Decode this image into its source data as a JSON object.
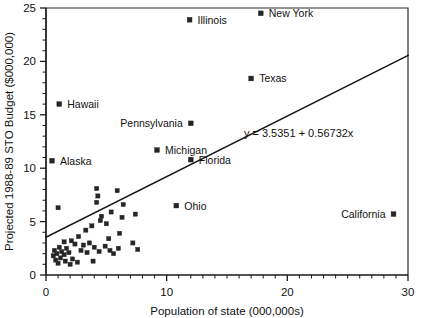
{
  "chart_data": {
    "type": "scatter",
    "title": "",
    "xlabel": "Population of state (000,000s)",
    "ylabel": "Projected 1988-89 STO Budget ($000,000)",
    "xlim": [
      0,
      30
    ],
    "ylim": [
      0,
      25
    ],
    "xticks": [
      0,
      10,
      20,
      30
    ],
    "yticks": [
      0,
      5,
      10,
      15,
      20,
      25
    ],
    "xtick_labels": [
      "0",
      "10",
      "20",
      "30"
    ],
    "ytick_labels": [
      "0",
      "5",
      "10",
      "15",
      "20",
      "25"
    ],
    "x_minor_step": 1,
    "y_minor_step": 1,
    "grid": false,
    "legend": "none",
    "marker": "filled-square",
    "marker_color": "#262626",
    "trendline": {
      "type": "linear",
      "intercept": 3.5351,
      "slope": 0.56732,
      "equation": "y = 3.5351 + 0.56732x",
      "label_x": 16.4,
      "label_y": 12.9,
      "x_start": 0,
      "x_end": 30
    },
    "labeled_points": [
      {
        "label": "New York",
        "x": 17.8,
        "y": 24.5,
        "label_side": "right"
      },
      {
        "label": "Illinois",
        "x": 11.9,
        "y": 23.9,
        "label_side": "right"
      },
      {
        "label": "Texas",
        "x": 17.0,
        "y": 18.4,
        "label_side": "right"
      },
      {
        "label": "Hawaii",
        "x": 1.1,
        "y": 16.0,
        "label_side": "right"
      },
      {
        "label": "Pennsylvania",
        "x": 12.0,
        "y": 14.2,
        "label_side": "left"
      },
      {
        "label": "Michigan",
        "x": 9.2,
        "y": 11.7,
        "label_side": "right"
      },
      {
        "label": "Alaska",
        "x": 0.5,
        "y": 10.7,
        "label_side": "right"
      },
      {
        "label": "Florida",
        "x": 12.0,
        "y": 10.8,
        "label_side": "right"
      },
      {
        "label": "Ohio",
        "x": 10.8,
        "y": 6.5,
        "label_side": "right"
      },
      {
        "label": "California",
        "x": 28.8,
        "y": 5.7,
        "label_side": "left"
      }
    ],
    "unlabeled_points": [
      {
        "x": 1.0,
        "y": 6.3
      },
      {
        "x": 4.2,
        "y": 8.1
      },
      {
        "x": 4.3,
        "y": 7.4
      },
      {
        "x": 4.2,
        "y": 6.8
      },
      {
        "x": 5.9,
        "y": 7.9
      },
      {
        "x": 6.4,
        "y": 6.6
      },
      {
        "x": 5.4,
        "y": 5.9
      },
      {
        "x": 4.6,
        "y": 5.5
      },
      {
        "x": 4.5,
        "y": 5.1
      },
      {
        "x": 3.8,
        "y": 4.6
      },
      {
        "x": 5.0,
        "y": 4.8
      },
      {
        "x": 6.3,
        "y": 5.4
      },
      {
        "x": 7.4,
        "y": 5.7
      },
      {
        "x": 3.3,
        "y": 4.2
      },
      {
        "x": 2.7,
        "y": 3.6
      },
      {
        "x": 2.1,
        "y": 3.2
      },
      {
        "x": 1.5,
        "y": 3.1
      },
      {
        "x": 2.4,
        "y": 2.9
      },
      {
        "x": 3.1,
        "y": 2.8
      },
      {
        "x": 3.6,
        "y": 3.0
      },
      {
        "x": 5.2,
        "y": 3.4
      },
      {
        "x": 6.1,
        "y": 3.9
      },
      {
        "x": 7.2,
        "y": 3.0
      },
      {
        "x": 7.6,
        "y": 2.4
      },
      {
        "x": 0.7,
        "y": 2.3
      },
      {
        "x": 0.9,
        "y": 2.0
      },
      {
        "x": 1.1,
        "y": 2.6
      },
      {
        "x": 1.3,
        "y": 2.2
      },
      {
        "x": 1.5,
        "y": 1.9
      },
      {
        "x": 1.7,
        "y": 2.5
      },
      {
        "x": 1.9,
        "y": 2.1
      },
      {
        "x": 1.2,
        "y": 1.6
      },
      {
        "x": 0.8,
        "y": 1.4
      },
      {
        "x": 2.2,
        "y": 1.5
      },
      {
        "x": 2.9,
        "y": 2.3
      },
      {
        "x": 3.4,
        "y": 2.1
      },
      {
        "x": 4.0,
        "y": 2.6
      },
      {
        "x": 4.4,
        "y": 2.2
      },
      {
        "x": 4.9,
        "y": 2.7
      },
      {
        "x": 5.6,
        "y": 2.0
      },
      {
        "x": 6.0,
        "y": 2.5
      },
      {
        "x": 2.6,
        "y": 1.2
      },
      {
        "x": 3.9,
        "y": 1.3
      },
      {
        "x": 1.0,
        "y": 1.1
      },
      {
        "x": 1.6,
        "y": 1.3
      },
      {
        "x": 0.6,
        "y": 1.8
      },
      {
        "x": 2.0,
        "y": 1.0
      },
      {
        "x": 5.3,
        "y": 2.3
      }
    ]
  }
}
